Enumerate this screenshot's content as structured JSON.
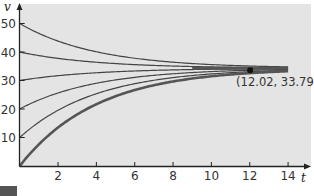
{
  "chart_data": {
    "type": "line",
    "title": "",
    "xlabel": "t",
    "ylabel": "v",
    "xlim": [
      0,
      15
    ],
    "ylim": [
      0,
      55
    ],
    "x_ticks": [
      2,
      4,
      6,
      8,
      10,
      12,
      14
    ],
    "y_ticks": [
      10,
      20,
      30,
      40,
      50
    ],
    "grid": false,
    "legend": null,
    "terminal_value": 34.3,
    "series": [
      {
        "name": "v(0)=50",
        "v0": 50,
        "t": [
          0,
          2,
          4,
          6,
          8,
          10,
          12,
          14
        ],
        "values": [
          50,
          43.8,
          40.1,
          37.8,
          36.4,
          35.6,
          35.1,
          34.8
        ]
      },
      {
        "name": "v(0)=40",
        "v0": 40,
        "t": [
          0,
          2,
          4,
          6,
          8,
          10,
          12,
          14
        ],
        "values": [
          40,
          37.8,
          36.4,
          35.6,
          35.1,
          34.8,
          34.6,
          34.4
        ]
      },
      {
        "name": "v(0)=30",
        "v0": 30,
        "t": [
          0,
          2,
          4,
          6,
          8,
          10,
          12,
          14
        ],
        "values": [
          30,
          31.7,
          32.7,
          33.3,
          33.7,
          33.9,
          34.1,
          34.2
        ]
      },
      {
        "name": "v(0)=20",
        "v0": 20,
        "t": [
          0,
          2,
          4,
          6,
          8,
          10,
          12,
          14
        ],
        "values": [
          20,
          25.6,
          29.0,
          31.1,
          32.4,
          33.1,
          33.6,
          33.9
        ]
      },
      {
        "name": "v(0)=10",
        "v0": 10,
        "t": [
          0,
          2,
          4,
          6,
          8,
          10,
          12,
          14
        ],
        "values": [
          10,
          19.6,
          25.4,
          28.9,
          31.0,
          32.3,
          33.1,
          33.6
        ]
      },
      {
        "name": "v(0)=0",
        "v0": 0,
        "emphasized": true,
        "t": [
          0,
          2,
          4,
          6,
          8,
          10,
          12,
          14
        ],
        "values": [
          0,
          13.5,
          21.7,
          26.6,
          29.7,
          31.5,
          32.6,
          33.2
        ]
      }
    ],
    "annotations": [
      {
        "text": "(12.02, 33.79)",
        "x": 12.02,
        "y": 33.79,
        "marker": "dot"
      }
    ]
  },
  "labels": {
    "x_axis": "t",
    "y_axis": "v",
    "point_label": "(12.02, 33.79)"
  },
  "colors": {
    "plot_bg": "#e4e4e4",
    "curve": "#444444",
    "thick_curve": "#555555",
    "axis": "#222222"
  }
}
